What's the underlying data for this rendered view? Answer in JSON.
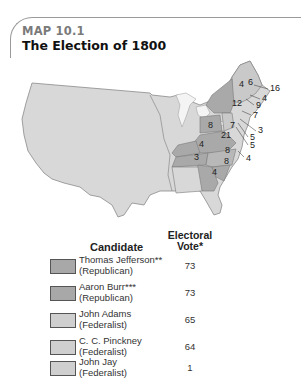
{
  "header": {
    "map_label": "MAP 10.1",
    "title": "The Election of 1800"
  },
  "map": {
    "state_votes": [
      {
        "state": "ME/MA",
        "votes": "16"
      },
      {
        "state": "NH",
        "votes": "6"
      },
      {
        "state": "VT",
        "votes": "4"
      },
      {
        "state": "RI",
        "votes": "4"
      },
      {
        "state": "CT",
        "votes": "9"
      },
      {
        "state": "NY",
        "votes": "12"
      },
      {
        "state": "NJ",
        "votes": "7"
      },
      {
        "state": "PA",
        "votes": "8"
      },
      {
        "state": "NJ-label",
        "votes": "7"
      },
      {
        "state": "DE",
        "votes": "3"
      },
      {
        "state": "MD-a",
        "votes": "5"
      },
      {
        "state": "MD-b",
        "votes": "5"
      },
      {
        "state": "VA",
        "votes": "21"
      },
      {
        "state": "KY",
        "votes": "4"
      },
      {
        "state": "TN",
        "votes": "3"
      },
      {
        "state": "NC-a",
        "votes": "8"
      },
      {
        "state": "NC-b",
        "votes": "4"
      },
      {
        "state": "SC",
        "votes": "8"
      },
      {
        "state": "GA",
        "votes": "4"
      }
    ],
    "colors": {
      "land": "#d6d6d6",
      "republican": "#a9a9a9",
      "federalist": "#c9c9c9",
      "split": "#b8b8b8",
      "water": "#ffffff"
    }
  },
  "legend": {
    "header_candidate": "Candidate",
    "header_vote_line1": "Electoral",
    "header_vote_line2": "Vote*",
    "rows": [
      {
        "name": "Thomas Jefferson**",
        "party": "(Republican)",
        "votes": "73",
        "color": "#a8a8a8"
      },
      {
        "name": "Aaron Burr***",
        "party": "(Republican)",
        "votes": "73",
        "color": "#a8a8a8"
      },
      {
        "name": "John Adams",
        "party": "(Federalist)",
        "votes": "65",
        "color": "#cfcfcf"
      },
      {
        "name": "C. C. Pinckney",
        "party": "(Federalist)",
        "votes": "64",
        "color": "#cfcfcf"
      },
      {
        "name": "John Jay",
        "party": "(Federalist)",
        "votes": "1",
        "color": "#cfcfcf"
      }
    ]
  }
}
